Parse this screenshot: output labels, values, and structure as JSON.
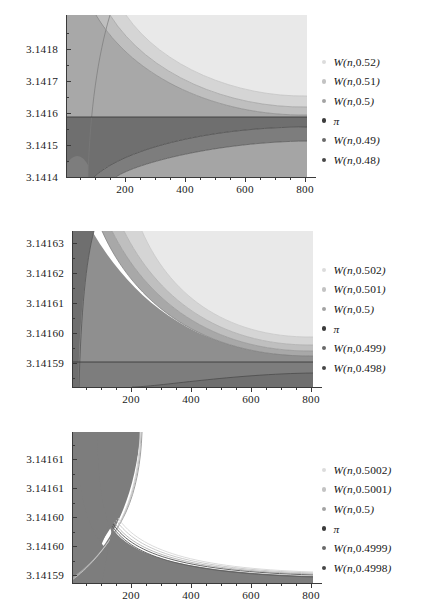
{
  "figure": {
    "kind": "multi-panel-line-chart",
    "panel_count": 3,
    "background": "#ffffff"
  },
  "palette": {
    "band_1": "#e9e9e9",
    "band_2": "#d5d5d5",
    "band_3": "#bfbfbf",
    "band_4": "#a8a8a8",
    "band_5": "#8f8f8f",
    "band_6": "#6f6f6f",
    "curve_light": "#b9b9b9",
    "curve_mid": "#8a8a8a",
    "curve_dark": "#4b4b4b",
    "pi_line": "#3b3b3b",
    "axis": "#3a3a3a",
    "text": "#1a1a1a"
  },
  "chart_data": [
    {
      "type": "line",
      "title": "",
      "xlabel": "",
      "ylabel": "",
      "xlim": [
        0,
        840
      ],
      "ylim": [
        3.14135,
        3.141855
      ],
      "grid": false,
      "legend_position": "right",
      "xticks": [
        200,
        400,
        600,
        800
      ],
      "xtick_labels": [
        "200",
        "400",
        "600",
        "800"
      ],
      "yticks": [
        3.1414,
        3.1415,
        3.1416,
        3.1417,
        3.1418
      ],
      "ytick_labels": [
        "3.1414",
        "3.1415",
        "3.1416",
        "3.1417",
        "3.1418"
      ],
      "reference_line": {
        "name": "pi",
        "value": 3.14159265
      },
      "series": [
        {
          "name": "W(n,0.52)",
          "label": "W(n,0.52)",
          "color": "#dcdcdc",
          "param": 0.52,
          "x": [
            10,
            25,
            50,
            100,
            150,
            200,
            300,
            400,
            500,
            600,
            700,
            800
          ],
          "y": [
            3.14187,
            3.141865,
            3.141855,
            3.141826,
            3.141801,
            3.141781,
            3.141751,
            3.141731,
            3.141717,
            3.141706,
            3.141698,
            3.141691
          ]
        },
        {
          "name": "W(n,0.51)",
          "label": "W(n,0.51)",
          "color": "#c3c3c3",
          "param": 0.51,
          "x": [
            10,
            25,
            50,
            100,
            150,
            200,
            300,
            400,
            500,
            600,
            700,
            800
          ],
          "y": [
            3.141865,
            3.141845,
            3.141815,
            3.141762,
            3.141727,
            3.141702,
            3.141669,
            3.141649,
            3.141636,
            3.141626,
            3.141619,
            3.141613
          ]
        },
        {
          "name": "W(n,0.5)",
          "label": "W(n,0.5)",
          "color": "#a3a3a3",
          "param": 0.5,
          "x": [
            10,
            25,
            50,
            100,
            150,
            200,
            300,
            400,
            500,
            600,
            700,
            800
          ],
          "y": [
            3.141855,
            3.141812,
            3.141755,
            3.141675,
            3.141638,
            3.141618,
            3.1416,
            3.141594,
            3.141592,
            3.141592,
            3.141592,
            3.141592
          ]
        },
        {
          "name": "pi",
          "label": "π",
          "color": "#3b3b3b",
          "param": null,
          "x": [
            0,
            840
          ],
          "y": [
            3.14159265,
            3.14159265
          ]
        },
        {
          "name": "W(n,0.49)",
          "label": "W(n,0.49)",
          "color": "#6a6a6a",
          "param": 0.49,
          "x": [
            10,
            25,
            50,
            100,
            150,
            200,
            300,
            400,
            500,
            600,
            700,
            800
          ],
          "y": [
            3.1414,
            3.141406,
            3.141428,
            3.141472,
            3.141501,
            3.141519,
            3.141542,
            3.141554,
            3.141562,
            3.141567,
            3.141571,
            3.141574
          ]
        },
        {
          "name": "W(n,0.48)",
          "label": "W(n,0.48)",
          "color": "#474747",
          "param": 0.48,
          "x": [
            10,
            25,
            50,
            100,
            150,
            200,
            300,
            400,
            500,
            600,
            700,
            800
          ],
          "y": [
            3.14136,
            3.141352,
            3.141368,
            3.141412,
            3.141444,
            3.141466,
            3.141495,
            3.141511,
            3.141521,
            3.141528,
            3.141533,
            3.141537
          ]
        }
      ]
    },
    {
      "type": "line",
      "title": "",
      "xlabel": "",
      "ylabel": "",
      "xlim": [
        0,
        840
      ],
      "ylim": [
        3.141585,
        3.1416335
      ],
      "grid": false,
      "legend_position": "right",
      "xticks": [
        200,
        400,
        600,
        800
      ],
      "xtick_labels": [
        "200",
        "400",
        "600",
        "800"
      ],
      "yticks": [
        3.14159,
        3.1416,
        3.14161,
        3.14162,
        3.14163
      ],
      "ytick_labels": [
        "3.14159",
        "3.14160",
        "3.14161",
        "3.14162",
        "3.14163"
      ],
      "reference_line": {
        "name": "pi",
        "value": 3.14159265
      },
      "series": [
        {
          "name": "W(n,0.502)",
          "label": "W(n,0.502)",
          "color": "#dcdcdc",
          "param": 0.502,
          "x": [
            10,
            25,
            50,
            100,
            150,
            200,
            300,
            400,
            500,
            600,
            700,
            800
          ],
          "y": [
            3.141638,
            3.141636,
            3.141632,
            3.141623,
            3.141616,
            3.141611,
            3.141604,
            3.141601,
            3.141599,
            3.141598,
            3.141597,
            3.141597
          ]
        },
        {
          "name": "W(n,0.501)",
          "label": "W(n,0.501)",
          "color": "#c3c3c3",
          "param": 0.501,
          "x": [
            10,
            25,
            50,
            100,
            150,
            200,
            300,
            400,
            500,
            600,
            700,
            800
          ],
          "y": [
            3.141637,
            3.141633,
            3.141627,
            3.141615,
            3.141608,
            3.141603,
            3.141598,
            3.141596,
            3.141595,
            3.141594,
            3.141594,
            3.141594
          ]
        },
        {
          "name": "W(n,0.5)",
          "label": "W(n,0.5)",
          "color": "#a3a3a3",
          "param": 0.5,
          "x": [
            10,
            25,
            50,
            100,
            150,
            200,
            300,
            400,
            500,
            600,
            700,
            800
          ],
          "y": [
            3.141636,
            3.14163,
            3.141621,
            3.141607,
            3.1416,
            3.141597,
            3.141594,
            3.141593,
            3.141593,
            3.141593,
            3.141593,
            3.141593
          ]
        },
        {
          "name": "pi",
          "label": "π",
          "color": "#3b3b3b",
          "param": null,
          "x": [
            0,
            840
          ],
          "y": [
            3.14159265,
            3.14159265
          ]
        },
        {
          "name": "W(n,0.499)",
          "label": "W(n,0.499)",
          "color": "#6a6a6a",
          "param": 0.499,
          "x": [
            10,
            25,
            50,
            100,
            150,
            200,
            300,
            400,
            500,
            600,
            700,
            800
          ],
          "y": [
            3.141583,
            3.141584,
            3.141585,
            3.141587,
            3.141588,
            3.141589,
            3.14159,
            3.141591,
            3.141591,
            3.141592,
            3.141592,
            3.141592
          ]
        },
        {
          "name": "W(n,0.498)",
          "label": "W(n,0.498)",
          "color": "#474747",
          "param": 0.498,
          "x": [
            10,
            25,
            50,
            100,
            150,
            200,
            300,
            400,
            500,
            600,
            700,
            800
          ],
          "y": [
            3.141581,
            3.141581,
            3.141582,
            3.141584,
            3.141585,
            3.141586,
            3.141588,
            3.141589,
            3.14159,
            3.14159,
            3.141591,
            3.141591
          ]
        }
      ]
    },
    {
      "type": "line",
      "title": "",
      "xlabel": "",
      "ylabel": "",
      "xlim": [
        0,
        840
      ],
      "ylim": [
        3.1415925,
        3.1416145
      ],
      "grid": false,
      "legend_position": "right",
      "xticks": [
        200,
        400,
        600,
        800
      ],
      "xtick_labels": [
        "200",
        "400",
        "600",
        "800"
      ],
      "yticks": [
        3.14159,
        3.1416,
        3.141604,
        3.141608,
        3.141612
      ],
      "ytick_labels": [
        "3.14159",
        "3.14160",
        "3.14160",
        "3.14161",
        "3.14161"
      ],
      "reference_line": {
        "name": "pi",
        "value": 3.14159265
      },
      "series": [
        {
          "name": "W(n,0.5002)",
          "label": "W(n,0.5002)",
          "color": "#dcdcdc",
          "param": 0.5002,
          "x": [
            10,
            40,
            80,
            120,
            160,
            200,
            300,
            400,
            500,
            600,
            700,
            800
          ],
          "y": [
            3.1416148,
            3.1416142,
            3.1416118,
            3.141607,
            3.1416026,
            3.1415996,
            3.1415953,
            3.1415936,
            3.1415929,
            3.1415926,
            3.1415924,
            3.1415923
          ]
        },
        {
          "name": "W(n,0.5001)",
          "label": "W(n,0.5001)",
          "color": "#c3c3c3",
          "param": 0.5001,
          "x": [
            10,
            40,
            80,
            120,
            160,
            200,
            300,
            400,
            500,
            600,
            700,
            800
          ],
          "y": [
            3.1416147,
            3.1416138,
            3.1416108,
            3.1416055,
            3.1416012,
            3.1415985,
            3.1415946,
            3.1415932,
            3.1415927,
            3.1415925,
            3.1415924,
            3.1415923
          ]
        },
        {
          "name": "W(n,0.5)",
          "label": "W(n,0.5)",
          "color": "#a3a3a3",
          "param": 0.5,
          "x": [
            10,
            40,
            80,
            120,
            160,
            200,
            300,
            400,
            500,
            600,
            700,
            800
          ],
          "y": [
            3.1416146,
            3.1416134,
            3.1416098,
            3.1416042,
            3.1416,
            3.1415975,
            3.141594,
            3.141593,
            3.1415927,
            3.1415926,
            3.1415926,
            3.1415926
          ]
        },
        {
          "name": "pi",
          "label": "π",
          "color": "#3b3b3b",
          "param": null,
          "x": [
            0,
            840
          ],
          "y": [
            3.14159265,
            3.14159265
          ]
        },
        {
          "name": "W(n,0.4999)",
          "label": "W(n,0.4999)",
          "color": "#6a6a6a",
          "param": 0.4999,
          "x": [
            10,
            40,
            80,
            120,
            160,
            200,
            300,
            400,
            500,
            600,
            700,
            800
          ],
          "y": [
            3.1416145,
            3.141613,
            3.1416088,
            3.141603,
            3.1415988,
            3.1415965,
            3.1415935,
            3.1415928,
            3.1415926,
            3.1415926,
            3.1415926,
            3.1415926
          ]
        },
        {
          "name": "W(n,0.4998)",
          "label": "W(n,0.4998)",
          "color": "#474747",
          "param": 0.4998,
          "x": [
            10,
            40,
            80,
            120,
            160,
            200,
            300,
            400,
            500,
            600,
            700,
            800
          ],
          "y": [
            3.1416144,
            3.1416126,
            3.1416078,
            3.1416018,
            3.1415976,
            3.1415955,
            3.141593,
            3.1415926,
            3.1415925,
            3.1415925,
            3.1415925,
            3.1415925
          ]
        }
      ]
    }
  ]
}
